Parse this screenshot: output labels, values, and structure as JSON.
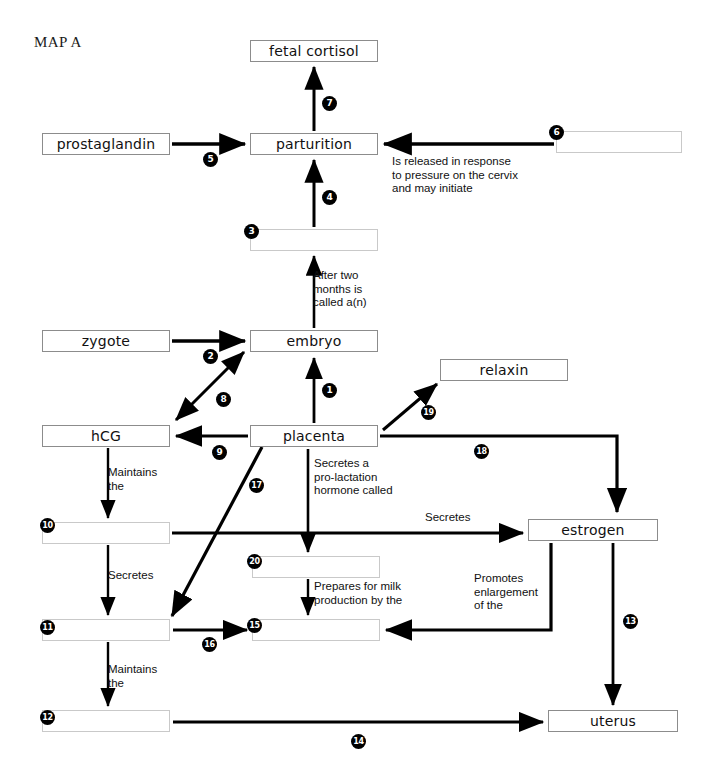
{
  "title": "MAP A",
  "diagram": {
    "kind": "concept-map",
    "topic": "Pregnancy hormones and parturition",
    "nodes": [
      {
        "id": "fetal-cortisol",
        "label": "fetal cortisol",
        "blank": false,
        "x": 250,
        "y": 40,
        "w": 128,
        "h": 22
      },
      {
        "id": "prostaglandin",
        "label": "prostaglandin",
        "blank": false,
        "x": 42,
        "y": 133,
        "w": 128,
        "h": 22
      },
      {
        "id": "parturition",
        "label": "parturition",
        "blank": false,
        "x": 250,
        "y": 133,
        "w": 128,
        "h": 22
      },
      {
        "id": "blank-6",
        "label": "",
        "blank": true,
        "x": 556,
        "y": 131,
        "w": 126,
        "h": 22
      },
      {
        "id": "blank-3",
        "label": "",
        "blank": true,
        "x": 250,
        "y": 229,
        "w": 128,
        "h": 22
      },
      {
        "id": "zygote",
        "label": "zygote",
        "blank": false,
        "x": 42,
        "y": 330,
        "w": 128,
        "h": 22
      },
      {
        "id": "embryo",
        "label": "embryo",
        "blank": false,
        "x": 250,
        "y": 330,
        "w": 128,
        "h": 22
      },
      {
        "id": "relaxin",
        "label": "relaxin",
        "blank": false,
        "x": 440,
        "y": 359,
        "w": 128,
        "h": 22
      },
      {
        "id": "hcg",
        "label": "hCG",
        "blank": false,
        "x": 42,
        "y": 425,
        "w": 128,
        "h": 22
      },
      {
        "id": "placenta",
        "label": "placenta",
        "blank": false,
        "x": 250,
        "y": 425,
        "w": 128,
        "h": 22
      },
      {
        "id": "blank-10",
        "label": "",
        "blank": true,
        "x": 42,
        "y": 522,
        "w": 128,
        "h": 22
      },
      {
        "id": "estrogen",
        "label": "estrogen",
        "blank": false,
        "x": 528,
        "y": 519,
        "w": 130,
        "h": 22
      },
      {
        "id": "blank-20",
        "label": "",
        "blank": true,
        "x": 252,
        "y": 556,
        "w": 128,
        "h": 22
      },
      {
        "id": "blank-11",
        "label": "",
        "blank": true,
        "x": 42,
        "y": 619,
        "w": 128,
        "h": 22
      },
      {
        "id": "blank-15",
        "label": "",
        "blank": true,
        "x": 252,
        "y": 619,
        "w": 128,
        "h": 22
      },
      {
        "id": "blank-12",
        "label": "",
        "blank": true,
        "x": 42,
        "y": 710,
        "w": 128,
        "h": 22
      },
      {
        "id": "uterus",
        "label": "uterus",
        "blank": false,
        "x": 548,
        "y": 710,
        "w": 130,
        "h": 22
      }
    ],
    "numbers": [
      {
        "n": "1",
        "x": 322,
        "y": 383,
        "for": "placenta-to-embryo"
      },
      {
        "n": "2",
        "x": 203,
        "y": 349,
        "for": "zygote-to-embryo"
      },
      {
        "n": "3",
        "x": 244,
        "y": 224,
        "for": "blank-3"
      },
      {
        "n": "4",
        "x": 322,
        "y": 190,
        "for": "blank3-to-parturition"
      },
      {
        "n": "5",
        "x": 203,
        "y": 152,
        "for": "prostaglandin-to-parturition"
      },
      {
        "n": "6",
        "x": 549,
        "y": 125,
        "for": "blank-6"
      },
      {
        "n": "7",
        "x": 322,
        "y": 96,
        "for": "parturition-to-fetal-cortisol"
      },
      {
        "n": "8",
        "x": 216,
        "y": 392,
        "for": "embryo-hcg-bidirectional"
      },
      {
        "n": "9",
        "x": 212,
        "y": 445,
        "for": "placenta-to-hcg"
      },
      {
        "n": "10",
        "x": 40,
        "y": 518,
        "for": "blank-10"
      },
      {
        "n": "11",
        "x": 40,
        "y": 620,
        "for": "blank-11"
      },
      {
        "n": "12",
        "x": 40,
        "y": 710,
        "for": "blank-12"
      },
      {
        "n": "13",
        "x": 623,
        "y": 614,
        "for": "estrogen-to-uterus"
      },
      {
        "n": "14",
        "x": 351,
        "y": 734,
        "for": "blank12-to-uterus"
      },
      {
        "n": "15",
        "x": 247,
        "y": 618,
        "for": "blank-15"
      },
      {
        "n": "16",
        "x": 202,
        "y": 637,
        "for": "blank11-to-blank15"
      },
      {
        "n": "17",
        "x": 249,
        "y": 478,
        "for": "placenta-to-blank11"
      },
      {
        "n": "18",
        "x": 474,
        "y": 444,
        "for": "placenta-to-estrogen"
      },
      {
        "n": "19",
        "x": 421,
        "y": 405,
        "for": "placenta-to-relaxin"
      },
      {
        "n": "20",
        "x": 247,
        "y": 554,
        "for": "blank-20"
      }
    ],
    "edge_labels": [
      {
        "id": "cervix-note",
        "text": "Is released in response\nto pressure on the cervix\nand may initiate",
        "x": 392,
        "y": 155,
        "align": "left"
      },
      {
        "id": "after-two-months",
        "text": "After two\nmonths is\ncalled a(n)",
        "x": 313,
        "y": 269,
        "align": "left"
      },
      {
        "id": "hcg-maintains",
        "text": "Maintains\nthe",
        "x": 108,
        "y": 466,
        "align": "left"
      },
      {
        "id": "prolactin-note",
        "text": "Secretes a\npro-lactation\nhormone called",
        "x": 314,
        "y": 457,
        "align": "left"
      },
      {
        "id": "secretes-estrogen",
        "text": "Secretes",
        "x": 425,
        "y": 511,
        "align": "left"
      },
      {
        "id": "blank10-secretes",
        "text": "Secretes",
        "x": 108,
        "y": 569,
        "align": "left"
      },
      {
        "id": "prepares-milk",
        "text": "Prepares for milk\nproduction by the",
        "x": 314,
        "y": 580,
        "align": "left"
      },
      {
        "id": "promotes-enlarge",
        "text": "Promotes\nenlargement\nof the",
        "x": 474,
        "y": 572,
        "align": "left"
      },
      {
        "id": "blank11-maintains",
        "text": "Maintains\nthe",
        "x": 108,
        "y": 663,
        "align": "left"
      }
    ]
  },
  "colors": {
    "ink": "#000000",
    "box_border": "#8c8c8c",
    "blank_border": "#c9c9c9",
    "background": "#ffffff"
  }
}
